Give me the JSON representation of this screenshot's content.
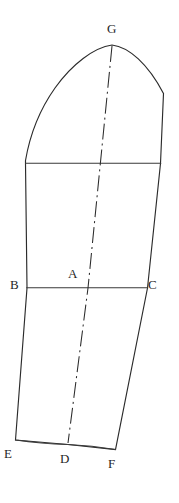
{
  "figure": {
    "type": "technical-line-drawing",
    "background_color": "#ffffff",
    "line_color": "#2b2b2b",
    "label_color": "#1f1f1f",
    "canvas": {
      "width": 179,
      "height": 503
    }
  },
  "labels": [
    {
      "id": "G",
      "text": "G",
      "x": 107,
      "y": 22,
      "role": "sleeve-cap-apex"
    },
    {
      "id": "B",
      "text": "B",
      "x": 10,
      "y": 278,
      "role": "left-bicep-point"
    },
    {
      "id": "A",
      "text": "A",
      "x": 68,
      "y": 267,
      "role": "center-bicep-point"
    },
    {
      "id": "C",
      "text": "C",
      "x": 148,
      "y": 278,
      "role": "right-bicep-point"
    },
    {
      "id": "E",
      "text": "E",
      "x": 4,
      "y": 447,
      "role": "left-hem-point"
    },
    {
      "id": "D",
      "text": "D",
      "x": 60,
      "y": 452,
      "role": "center-hem-point"
    },
    {
      "id": "F",
      "text": "F",
      "x": 108,
      "y": 457,
      "role": "right-hem-point"
    }
  ],
  "geometry": {
    "outline": "M 25.5 160.5 C 29 140 38 112 55 88 C 72 64 94 47.5 112 45 C 129 47 148 64 163.5 93.5 L 160.5 163.5 L 147.5 288 L 115.5 449.5 L 68 444.5 L 15.5 440 L 27 288 L 25.5 163.5 Z",
    "rules": [
      {
        "name": "cap-base-line",
        "d": "M 25.5 163.2 L 160.8 163.2"
      },
      {
        "name": "bicep-line-BC",
        "d": "M 26.6 287.8 L 147.8 287.8"
      }
    ],
    "center_line": {
      "name": "grainline-G-to-D",
      "d": "M 112 46 L 88 288 L 68 443"
    },
    "hem_curve": {
      "name": "hem-E-D-F",
      "d": "M 15.5 440 Q 41 443.8 68 444.6 Q 92 445.6 115.5 449.5"
    }
  }
}
